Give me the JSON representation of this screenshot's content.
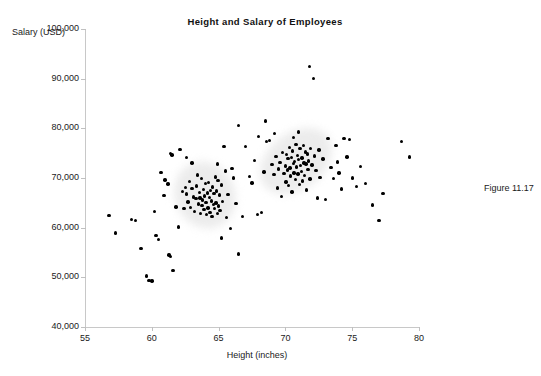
{
  "figure": {
    "caption": "Figure 11.17"
  },
  "chart_data": {
    "type": "scatter",
    "title": "Height and Salary of Employees",
    "xlabel": "Height (inches)",
    "ylabel": "Salary (USD)",
    "xlim": [
      55,
      80
    ],
    "ylim": [
      40000,
      100000
    ],
    "xticks": [
      55,
      60,
      65,
      70,
      75,
      80
    ],
    "xtick_labels": [
      "55",
      "60",
      "65",
      "70",
      "75",
      "80"
    ],
    "yticks": [
      40000,
      50000,
      60000,
      70000,
      80000,
      90000,
      100000
    ],
    "ytick_labels": [
      "40,000",
      "50,000",
      "60,000",
      "70,000",
      "80,000",
      "90,000",
      "100,000"
    ],
    "grid": false,
    "legend": null,
    "marker_color": "#000000",
    "marker_size": 3.4,
    "background_color": "#ffffff",
    "axis_color": "#c8c8c8",
    "clusters": [
      {
        "name": "shorter-group",
        "center_x": 64.0,
        "center_y": 66500,
        "halo": true
      },
      {
        "name": "taller-group",
        "center_x": 70.8,
        "center_y": 73500,
        "halo": true
      }
    ],
    "points": [
      [
        56.8,
        62400
      ],
      [
        57.3,
        58900
      ],
      [
        58.5,
        61700
      ],
      [
        58.8,
        61500
      ],
      [
        59.2,
        55800
      ],
      [
        59.6,
        50300
      ],
      [
        59.8,
        49400
      ],
      [
        60.0,
        49300
      ],
      [
        60.2,
        63200
      ],
      [
        60.3,
        58400
      ],
      [
        60.5,
        57600
      ],
      [
        60.7,
        71100
      ],
      [
        60.9,
        66500
      ],
      [
        61.0,
        69600
      ],
      [
        61.2,
        68800
      ],
      [
        61.4,
        74900
      ],
      [
        61.5,
        74600
      ],
      [
        61.6,
        51400
      ],
      [
        61.8,
        64200
      ],
      [
        62.0,
        60100
      ],
      [
        62.1,
        75800
      ],
      [
        62.3,
        67300
      ],
      [
        62.4,
        63900
      ],
      [
        62.5,
        68100
      ],
      [
        62.6,
        66800
      ],
      [
        62.7,
        65200
      ],
      [
        62.8,
        69300
      ],
      [
        62.9,
        64100
      ],
      [
        63.0,
        67900
      ],
      [
        63.1,
        66200
      ],
      [
        63.2,
        63300
      ],
      [
        63.3,
        65900
      ],
      [
        63.35,
        68400
      ],
      [
        63.4,
        70600
      ],
      [
        63.5,
        64800
      ],
      [
        63.55,
        67100
      ],
      [
        63.6,
        66000
      ],
      [
        63.65,
        62900
      ],
      [
        63.7,
        69900
      ],
      [
        63.75,
        64500
      ],
      [
        63.8,
        65600
      ],
      [
        63.85,
        67700
      ],
      [
        63.9,
        63600
      ],
      [
        63.95,
        66400
      ],
      [
        64.0,
        68900
      ],
      [
        64.05,
        65100
      ],
      [
        64.1,
        62600
      ],
      [
        64.15,
        67000
      ],
      [
        64.2,
        64000
      ],
      [
        64.25,
        69100
      ],
      [
        64.3,
        66100
      ],
      [
        64.35,
        63100
      ],
      [
        64.4,
        67500
      ],
      [
        64.45,
        65400
      ],
      [
        64.5,
        62300
      ],
      [
        64.55,
        68200
      ],
      [
        64.6,
        64700
      ],
      [
        64.65,
        66900
      ],
      [
        64.7,
        63800
      ],
      [
        64.75,
        70200
      ],
      [
        64.8,
        65000
      ],
      [
        64.85,
        67400
      ],
      [
        64.9,
        62800
      ],
      [
        64.95,
        69500
      ],
      [
        65.0,
        64400
      ],
      [
        65.05,
        66600
      ],
      [
        65.1,
        63400
      ],
      [
        65.2,
        68600
      ],
      [
        65.3,
        65300
      ],
      [
        65.4,
        76300
      ],
      [
        65.5,
        71400
      ],
      [
        65.6,
        62100
      ],
      [
        65.7,
        66700
      ],
      [
        65.9,
        59800
      ],
      [
        66.1,
        70000
      ],
      [
        66.3,
        64900
      ],
      [
        66.5,
        80600
      ],
      [
        66.8,
        62200
      ],
      [
        67.0,
        76400
      ],
      [
        67.3,
        70300
      ],
      [
        67.5,
        69000
      ],
      [
        67.7,
        73500
      ],
      [
        67.9,
        62700
      ],
      [
        68.0,
        78400
      ],
      [
        68.2,
        63000
      ],
      [
        68.4,
        71200
      ],
      [
        68.6,
        77300
      ],
      [
        68.8,
        77600
      ],
      [
        69.0,
        72700
      ],
      [
        69.15,
        70700
      ],
      [
        69.3,
        74300
      ],
      [
        69.4,
        68000
      ],
      [
        69.5,
        71800
      ],
      [
        69.6,
        73100
      ],
      [
        69.7,
        66300
      ],
      [
        69.8,
        75100
      ],
      [
        69.9,
        70900
      ],
      [
        70.0,
        72400
      ],
      [
        70.05,
        69200
      ],
      [
        70.1,
        74700
      ],
      [
        70.15,
        71600
      ],
      [
        70.2,
        73900
      ],
      [
        70.25,
        68500
      ],
      [
        70.3,
        76100
      ],
      [
        70.35,
        72000
      ],
      [
        70.4,
        70400
      ],
      [
        70.45,
        74100
      ],
      [
        70.5,
        67200
      ],
      [
        70.55,
        75400
      ],
      [
        70.6,
        72900
      ],
      [
        70.65,
        71000
      ],
      [
        70.7,
        73300
      ],
      [
        70.75,
        69700
      ],
      [
        70.8,
        76800
      ],
      [
        70.85,
        72200
      ],
      [
        70.9,
        74500
      ],
      [
        70.95,
        70800
      ],
      [
        71.0,
        73700
      ],
      [
        71.05,
        68700
      ],
      [
        71.1,
        75900
      ],
      [
        71.15,
        72500
      ],
      [
        71.2,
        71300
      ],
      [
        71.25,
        74000
      ],
      [
        71.3,
        69400
      ],
      [
        71.35,
        76600
      ],
      [
        71.4,
        73000
      ],
      [
        71.45,
        70500
      ],
      [
        71.5,
        75200
      ],
      [
        71.55,
        72800
      ],
      [
        71.6,
        67600
      ],
      [
        71.65,
        74800
      ],
      [
        71.7,
        71700
      ],
      [
        71.75,
        73400
      ],
      [
        71.8,
        92500
      ],
      [
        71.85,
        69800
      ],
      [
        71.9,
        76000
      ],
      [
        72.0,
        72600
      ],
      [
        72.1,
        90000
      ],
      [
        72.2,
        74400
      ],
      [
        72.3,
        71500
      ],
      [
        72.4,
        66000
      ],
      [
        72.5,
        75600
      ],
      [
        72.6,
        70100
      ],
      [
        72.8,
        73800
      ],
      [
        73.0,
        65700
      ],
      [
        73.2,
        77900
      ],
      [
        73.4,
        72100
      ],
      [
        73.6,
        69900
      ],
      [
        73.8,
        76500
      ],
      [
        74.0,
        71000
      ],
      [
        74.2,
        67800
      ],
      [
        74.4,
        78000
      ],
      [
        74.6,
        74200
      ],
      [
        74.8,
        77800
      ],
      [
        75.0,
        70000
      ],
      [
        75.3,
        68300
      ],
      [
        75.6,
        72300
      ],
      [
        76.0,
        68900
      ],
      [
        76.5,
        64600
      ],
      [
        77.0,
        61400
      ],
      [
        77.3,
        66900
      ],
      [
        78.7,
        77400
      ],
      [
        79.3,
        74200
      ],
      [
        73.9,
        73200
      ],
      [
        68.5,
        81500
      ],
      [
        70.6,
        78200
      ],
      [
        71.0,
        79300
      ],
      [
        69.2,
        79000
      ],
      [
        66.0,
        71900
      ],
      [
        64.9,
        72800
      ],
      [
        63.0,
        73000
      ],
      [
        62.6,
        74100
      ],
      [
        65.2,
        57900
      ],
      [
        66.5,
        54700
      ],
      [
        61.3,
        54500
      ],
      [
        61.4,
        54200
      ]
    ]
  }
}
